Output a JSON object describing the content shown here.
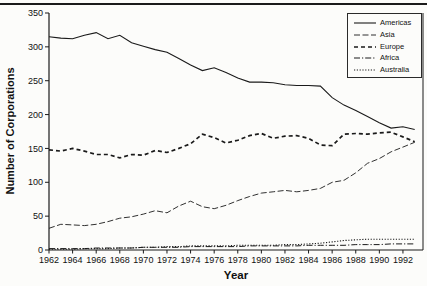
{
  "chart_data": {
    "type": "line",
    "title": "",
    "xlabel": "Year",
    "ylabel": "Number of Corporations",
    "grid": false,
    "legend_position": "top-right",
    "axis_color": "#1a1a1a",
    "line_color": "#1a1a1a",
    "xlim": [
      1962,
      1993.7
    ],
    "ylim": [
      0,
      350
    ],
    "x_ticks": [
      1962,
      1964,
      1966,
      1968,
      1970,
      1972,
      1974,
      1976,
      1978,
      1980,
      1982,
      1984,
      1986,
      1988,
      1990,
      1992
    ],
    "y_ticks": [
      0,
      50,
      100,
      150,
      200,
      250,
      300,
      350
    ],
    "x": [
      1962,
      1963,
      1964,
      1965,
      1966,
      1967,
      1968,
      1969,
      1970,
      1971,
      1972,
      1973,
      1974,
      1975,
      1976,
      1977,
      1978,
      1979,
      1980,
      1981,
      1982,
      1983,
      1984,
      1985,
      1986,
      1987,
      1988,
      1989,
      1990,
      1991,
      1992,
      1993
    ],
    "series": [
      {
        "name": "Americas",
        "dash": "none",
        "width": 1.1,
        "values": [
          315,
          313,
          312,
          317,
          321,
          312,
          317,
          306,
          301,
          296,
          292,
          283,
          273,
          265,
          269,
          262,
          254,
          248,
          248,
          247,
          244,
          243,
          243,
          242,
          225,
          214,
          206,
          197,
          188,
          180,
          182,
          178
        ]
      },
      {
        "name": "Asia",
        "dash": "6 2.5",
        "width": 0.9,
        "values": [
          32,
          38,
          37,
          36,
          38,
          42,
          47,
          49,
          53,
          58,
          55,
          65,
          72,
          64,
          61,
          66,
          73,
          79,
          84,
          86,
          88,
          86,
          88,
          91,
          100,
          103,
          114,
          128,
          135,
          145,
          152,
          159
        ]
      },
      {
        "name": "Europe",
        "dash": "4 3",
        "width": 1.7,
        "values": [
          148,
          146,
          150,
          146,
          141,
          141,
          136,
          141,
          140,
          147,
          144,
          150,
          157,
          171,
          166,
          158,
          162,
          169,
          172,
          165,
          168,
          169,
          165,
          155,
          154,
          171,
          172,
          171,
          173,
          174,
          167,
          160
        ]
      },
      {
        "name": "Africa",
        "dash": "6 2 1.2 2",
        "width": 1,
        "values": [
          2,
          2,
          2,
          2,
          3,
          3,
          3,
          3,
          4,
          4,
          4,
          4,
          5,
          5,
          5,
          5,
          5,
          6,
          6,
          6,
          6,
          6,
          7,
          7,
          7,
          7,
          8,
          8,
          8,
          9,
          9,
          9
        ]
      },
      {
        "name": "Australia",
        "dash": "1.2 1.6",
        "width": 1.1,
        "values": [
          1,
          1,
          1,
          2,
          2,
          2,
          3,
          3,
          4,
          4,
          5,
          5,
          6,
          6,
          6,
          6,
          7,
          7,
          7,
          7,
          8,
          8,
          9,
          10,
          12,
          14,
          15,
          16,
          16,
          16,
          16,
          16
        ]
      }
    ]
  }
}
